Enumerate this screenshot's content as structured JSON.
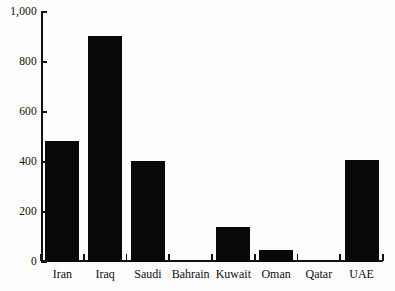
{
  "chart_data": {
    "type": "bar",
    "title": "",
    "subtitle": "",
    "xlabel": "",
    "ylabel": "",
    "categories": [
      "Iran",
      "Iraq",
      "Saudi",
      "Bahrain",
      "Kuwait",
      "Oman",
      "Qatar",
      "UAE"
    ],
    "values": [
      485,
      905,
      405,
      0,
      140,
      50,
      0,
      410
    ],
    "ylim": [
      0,
      1000
    ],
    "yticks": [
      0,
      200,
      400,
      600,
      800,
      1000
    ],
    "ytick_labels": [
      "0",
      "200",
      "400",
      "600",
      "800",
      "1,000"
    ],
    "grid": false,
    "legend": null,
    "bar_color": "#080808",
    "axis_color": "#111111",
    "background_color": "#fdfdfd"
  }
}
